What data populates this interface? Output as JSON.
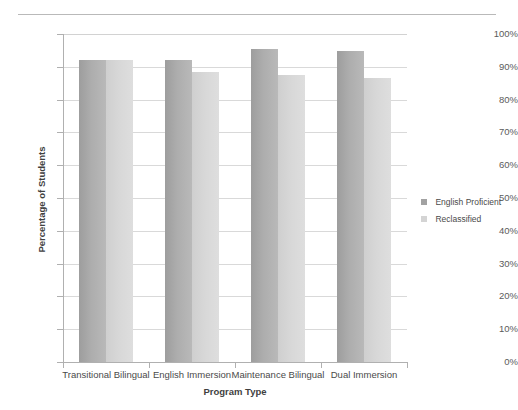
{
  "chart_data": {
    "type": "bar",
    "title": "",
    "xlabel": "Program Type",
    "ylabel": "Percentage of Students",
    "categories": [
      "Transitional Bilingual",
      "English Immersion",
      "Maintenance Bilingual",
      "Dual Immersion"
    ],
    "series": [
      {
        "name": "English Proficient",
        "color": "#a2a2a2",
        "values": [
          92,
          92,
          95.5,
          94.8
        ]
      },
      {
        "name": "Reclassified",
        "color": "#d4d4d4",
        "values": [
          92,
          88.3,
          87.5,
          86.7
        ]
      }
    ],
    "ylim": [
      0,
      100
    ],
    "y_tick_labels": [
      "100%",
      "90%",
      "80%",
      "70%",
      "60%",
      "50%",
      "40%",
      "30%",
      "20%",
      "10%",
      "0%"
    ],
    "y_tick_values": [
      100,
      90,
      80,
      70,
      60,
      50,
      40,
      30,
      20,
      10,
      0
    ],
    "grid": true,
    "legend_position": "right"
  }
}
